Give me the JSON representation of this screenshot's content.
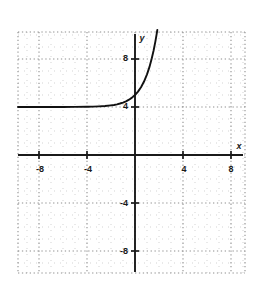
{
  "figure": {
    "kind": "cartesian-graph",
    "background_color": "#ffffff",
    "plot_area": {
      "left": 18,
      "top": 32,
      "right": 245,
      "bottom": 273
    }
  },
  "chart_data": {
    "type": "line",
    "title": "",
    "subtitle": "",
    "xlabel": "x",
    "ylabel": "y",
    "xlim": [
      -9.75,
      9.17
    ],
    "ylim": [
      -9.83,
      10.25
    ],
    "grid": true,
    "grid_major_step": 4,
    "grid_minor_step": 1,
    "grid_style": "dotted",
    "legend": null,
    "legend_position": "none",
    "axis_color": "#1a1a1a",
    "grid_color": "#b0b0b0",
    "curve_color": "#111111",
    "annotations": [
      {
        "text": "horizontal asymptote y = 4",
        "visible": false
      }
    ],
    "asymptote": 4,
    "xticks": [
      -8,
      -4,
      4,
      8
    ],
    "xtick_labels": [
      "-8",
      "-4",
      "4",
      "8"
    ],
    "yticks": [
      8,
      4,
      -4,
      -8
    ],
    "ytick_labels": [
      "8",
      "4",
      "-4",
      "-8"
    ],
    "series": [
      {
        "name": "exponential",
        "description": "y = 4 + e^x",
        "points": [
          [
            -9.75,
            4.0
          ],
          [
            -9.0,
            4.0
          ],
          [
            -8.0,
            4.0
          ],
          [
            -7.0,
            4.0
          ],
          [
            -6.0,
            4.0
          ],
          [
            -5.0,
            4.01
          ],
          [
            -4.0,
            4.02
          ],
          [
            -3.5,
            4.03
          ],
          [
            -3.0,
            4.05
          ],
          [
            -2.5,
            4.08
          ],
          [
            -2.0,
            4.14
          ],
          [
            -1.75,
            4.17
          ],
          [
            -1.5,
            4.22
          ],
          [
            -1.25,
            4.29
          ],
          [
            -1.0,
            4.37
          ],
          [
            -0.75,
            4.47
          ],
          [
            -0.5,
            4.61
          ],
          [
            -0.25,
            4.78
          ],
          [
            0.0,
            5.0
          ],
          [
            0.25,
            5.28
          ],
          [
            0.5,
            5.65
          ],
          [
            0.75,
            6.12
          ],
          [
            1.0,
            6.72
          ],
          [
            1.2,
            7.32
          ],
          [
            1.4,
            8.06
          ],
          [
            1.55,
            8.71
          ],
          [
            1.7,
            9.47
          ],
          [
            1.8,
            10.05
          ],
          [
            1.86,
            10.42
          ]
        ]
      }
    ]
  },
  "labels": {
    "x_axis_name": "x",
    "y_axis_name": "y"
  }
}
